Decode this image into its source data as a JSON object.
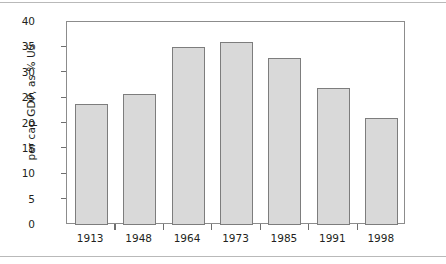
{
  "chart_data": {
    "type": "bar",
    "title": "",
    "xlabel": "",
    "ylabel": "per cap GDP, as % US",
    "categories": [
      "1913",
      "1948",
      "1964",
      "1973",
      "1985",
      "1991",
      "1998"
    ],
    "values": [
      23.8,
      25.8,
      35.0,
      36.1,
      33.0,
      27.0,
      21.0
    ],
    "ylim": [
      0,
      40
    ],
    "ytick_labels": [
      "0",
      "5",
      "10",
      "15",
      "20",
      "25",
      "30",
      "35",
      "40"
    ],
    "ytick_values": [
      0,
      5,
      10,
      15,
      20,
      25,
      30,
      35,
      40
    ],
    "grid": false,
    "legend": "none",
    "colors": {
      "bar_fill": "#d9d9d9",
      "bar_stroke": "#7d7d7d",
      "axis": "#8c8c8c",
      "text": "#231f20",
      "background": "#ffffff",
      "rule": "#b9b9b9"
    }
  }
}
